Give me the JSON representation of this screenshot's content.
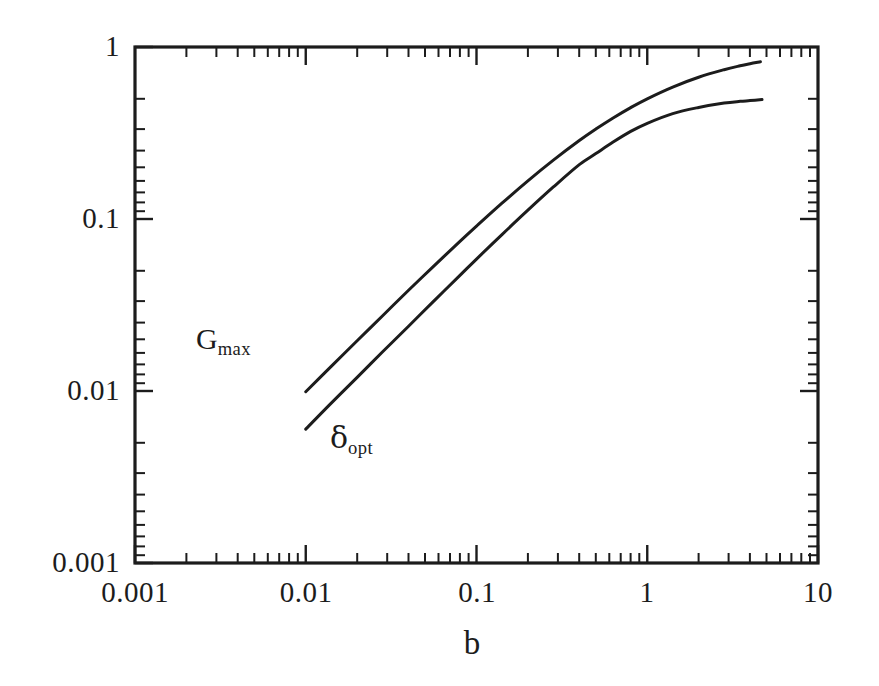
{
  "figure": {
    "background_color": "#ffffff",
    "ink_color": "#1c1c1c"
  },
  "axes": {
    "x_title": "b",
    "y_title": "",
    "x_tick_labels": [
      "0.001",
      "0.01",
      "0.1",
      "1",
      "10"
    ],
    "y_tick_labels": [
      "0.001",
      "0.01",
      "0.1",
      "1"
    ]
  },
  "curve_labels": {
    "gmax_base": "G",
    "gmax_sub": "max",
    "delta_base": "δ",
    "delta_sub": "opt"
  },
  "chart_data": {
    "type": "line",
    "title": "",
    "subtitle": "",
    "xlabel": "b",
    "ylabel": "",
    "xscale": "log",
    "yscale": "log",
    "xlim": [
      0.001,
      10
    ],
    "ylim": [
      0.001,
      1
    ],
    "xticks": [
      0.001,
      0.01,
      0.1,
      1,
      10
    ],
    "xticklabels": [
      "0.001",
      "0.01",
      "0.1",
      "1",
      "10"
    ],
    "yticks": [
      0.001,
      0.01,
      0.1,
      1
    ],
    "yticklabels": [
      "0.001",
      "0.01",
      "0.1",
      "1"
    ],
    "minor_ticks": true,
    "grid": false,
    "legend": "inline-annotations",
    "annotations": [
      {
        "text": "G_max",
        "x": 0.0115,
        "y": 0.0205,
        "target_series": "G_max"
      },
      {
        "text": "δ_opt",
        "x": 0.021,
        "y": 0.0072,
        "target_series": "δ_opt"
      }
    ],
    "series": [
      {
        "name": "G_max",
        "asymptote": 1.0,
        "x": [
          0.01,
          0.0141,
          0.02,
          0.0282,
          0.04,
          0.0562,
          0.08,
          0.1,
          0.141,
          0.2,
          0.282,
          0.4,
          0.5,
          0.631,
          0.8,
          1.0,
          1.41,
          2.0,
          2.82,
          3.5,
          4.0,
          4.6
        ],
        "y": [
          0.0099,
          0.0139,
          0.0196,
          0.0274,
          0.0385,
          0.0532,
          0.0741,
          0.0909,
          0.1236,
          0.1667,
          0.2199,
          0.2857,
          0.3333,
          0.3869,
          0.4444,
          0.5,
          0.585,
          0.667,
          0.738,
          0.778,
          0.8,
          0.821
        ]
      },
      {
        "name": "δ_opt",
        "asymptote": 0.5,
        "x": [
          0.01,
          0.0141,
          0.02,
          0.0282,
          0.04,
          0.0562,
          0.08,
          0.1,
          0.141,
          0.2,
          0.282,
          0.4,
          0.5,
          0.631,
          0.8,
          1.0,
          1.41,
          2.0,
          2.82,
          3.5,
          4.0,
          4.7
        ],
        "y": [
          0.006,
          0.0085,
          0.012,
          0.0169,
          0.0238,
          0.0333,
          0.047,
          0.0585,
          0.0812,
          0.1125,
          0.1535,
          0.207,
          0.24,
          0.28,
          0.323,
          0.36,
          0.41,
          0.445,
          0.472,
          0.483,
          0.488,
          0.495
        ]
      }
    ]
  }
}
